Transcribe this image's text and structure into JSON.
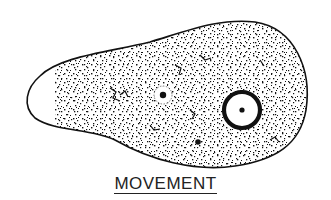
{
  "figure": {
    "caption": "MOVEMENT",
    "parts": [
      "cell membrane",
      "cytoplasm",
      "nucleus",
      "contractile vacuole",
      "food vacuole"
    ],
    "colors": {
      "ink": "#111111",
      "background": "#ffffff"
    }
  }
}
